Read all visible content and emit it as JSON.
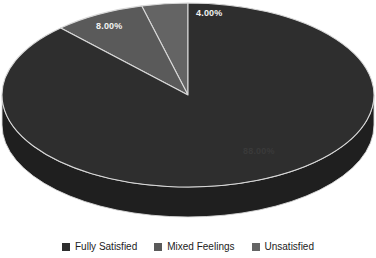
{
  "chart_data": {
    "type": "pie",
    "title": "",
    "subtitle": "",
    "xlabel": "",
    "ylabel": "",
    "three_d": true,
    "grid": false,
    "legend_position": "bottom",
    "categories": [
      "Fully Satisfied",
      "Mixed Feelings",
      "Unsatisfied"
    ],
    "values": [
      88.0,
      8.0,
      4.0
    ],
    "value_unit": "percent",
    "data_labels": [
      "88.00%",
      "8.00%",
      "4.00%"
    ],
    "colors": [
      "#2e2e2e",
      "#5a5a5a",
      "#646464"
    ],
    "slices": [
      {
        "label": "Fully Satisfied",
        "value": 88.0,
        "data_label": "88.00%",
        "color": "#2e2e2e",
        "side_color": "#1f1f1f",
        "label_color": "#3a3a3a"
      },
      {
        "label": "Mixed Feelings",
        "value": 8.0,
        "data_label": "8.00%",
        "color": "#5a5a5a",
        "side_color": "#404040",
        "label_color": "#f2f2f2"
      },
      {
        "label": "Unsatisfied",
        "value": 4.0,
        "data_label": "4.00%",
        "color": "#646464",
        "side_color": "#474747",
        "label_color": "#f2f2f2"
      }
    ]
  },
  "legend": {
    "items": [
      {
        "label": "Fully Satisfied",
        "color": "#2e2e2e"
      },
      {
        "label": "Mixed Feelings",
        "color": "#5a5a5a"
      },
      {
        "label": "Unsatisfied",
        "color": "#646464"
      }
    ]
  },
  "canvas": {
    "background": "#ffffff",
    "separator_color": "#d8d8d8"
  }
}
